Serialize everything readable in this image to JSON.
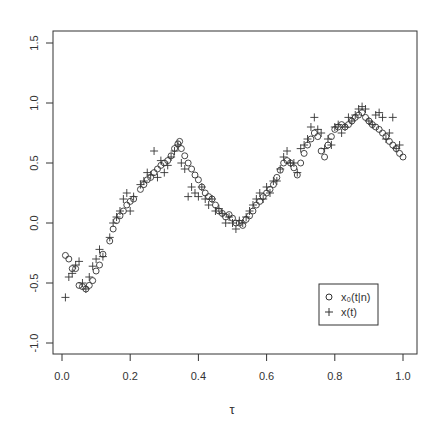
{
  "chart_data": {
    "type": "scatter",
    "title": "",
    "xlabel": "τ",
    "ylabel": "",
    "xlim": [
      0.0,
      1.0
    ],
    "ylim": [
      -1.0,
      1.5
    ],
    "x_ticks": [
      "0.0",
      "0.2",
      "0.4",
      "0.6",
      "0.8",
      "1.0"
    ],
    "y_ticks": [
      "-1.0",
      "-0.5",
      "0.0",
      "0.5",
      "1.0",
      "1.5"
    ],
    "grid": false,
    "legend_position": "bottom-right",
    "legend": [
      {
        "marker": "o",
        "label": "x₀(t|n)"
      },
      {
        "marker": "+",
        "label": "x(t)"
      }
    ],
    "series": [
      {
        "name": "x0(t|n)",
        "marker": "circle",
        "x": [
          0.01,
          0.02,
          0.03,
          0.04,
          0.05,
          0.06,
          0.07,
          0.08,
          0.09,
          0.1,
          0.11,
          0.12,
          0.14,
          0.15,
          0.16,
          0.17,
          0.18,
          0.19,
          0.2,
          0.21,
          0.23,
          0.24,
          0.25,
          0.26,
          0.27,
          0.28,
          0.29,
          0.3,
          0.31,
          0.32,
          0.33,
          0.34,
          0.345,
          0.35,
          0.36,
          0.37,
          0.38,
          0.39,
          0.4,
          0.41,
          0.42,
          0.43,
          0.44,
          0.45,
          0.46,
          0.47,
          0.48,
          0.49,
          0.5,
          0.51,
          0.52,
          0.53,
          0.54,
          0.55,
          0.56,
          0.57,
          0.58,
          0.59,
          0.6,
          0.61,
          0.62,
          0.63,
          0.64,
          0.65,
          0.66,
          0.67,
          0.68,
          0.69,
          0.7,
          0.71,
          0.72,
          0.73,
          0.74,
          0.75,
          0.76,
          0.77,
          0.78,
          0.79,
          0.8,
          0.81,
          0.82,
          0.83,
          0.84,
          0.85,
          0.86,
          0.87,
          0.88,
          0.89,
          0.9,
          0.91,
          0.92,
          0.93,
          0.94,
          0.95,
          0.96,
          0.97,
          0.98,
          0.99,
          1.0
        ],
        "y": [
          -0.27,
          -0.3,
          -0.38,
          -0.38,
          -0.52,
          -0.53,
          -0.55,
          -0.52,
          -0.48,
          -0.4,
          -0.35,
          -0.26,
          -0.15,
          -0.05,
          0.02,
          0.06,
          0.1,
          0.15,
          0.18,
          0.2,
          0.28,
          0.32,
          0.36,
          0.38,
          0.42,
          0.45,
          0.48,
          0.5,
          0.52,
          0.56,
          0.62,
          0.66,
          0.68,
          0.62,
          0.56,
          0.5,
          0.45,
          0.4,
          0.36,
          0.3,
          0.25,
          0.22,
          0.2,
          0.15,
          0.1,
          0.08,
          0.05,
          0.07,
          0.04,
          0.0,
          0.0,
          -0.02,
          0.03,
          0.06,
          0.1,
          0.15,
          0.18,
          0.22,
          0.25,
          0.28,
          0.32,
          0.38,
          0.44,
          0.5,
          0.52,
          0.5,
          0.46,
          0.4,
          0.5,
          0.58,
          0.65,
          0.7,
          0.75,
          0.72,
          0.6,
          0.55,
          0.65,
          0.72,
          0.78,
          0.8,
          0.82,
          0.8,
          0.82,
          0.85,
          0.88,
          0.9,
          0.92,
          0.88,
          0.85,
          0.82,
          0.8,
          0.78,
          0.75,
          0.72,
          0.68,
          0.65,
          0.62,
          0.58,
          0.55
        ]
      },
      {
        "name": "x(t)",
        "marker": "plus",
        "x": [
          0.01,
          0.02,
          0.03,
          0.04,
          0.05,
          0.06,
          0.07,
          0.08,
          0.09,
          0.1,
          0.11,
          0.12,
          0.14,
          0.15,
          0.16,
          0.17,
          0.18,
          0.19,
          0.2,
          0.21,
          0.23,
          0.24,
          0.25,
          0.26,
          0.27,
          0.28,
          0.29,
          0.3,
          0.31,
          0.32,
          0.33,
          0.34,
          0.35,
          0.36,
          0.37,
          0.38,
          0.39,
          0.4,
          0.41,
          0.42,
          0.43,
          0.44,
          0.45,
          0.46,
          0.47,
          0.48,
          0.49,
          0.5,
          0.51,
          0.52,
          0.53,
          0.54,
          0.55,
          0.56,
          0.57,
          0.58,
          0.59,
          0.6,
          0.61,
          0.62,
          0.63,
          0.64,
          0.65,
          0.66,
          0.67,
          0.68,
          0.69,
          0.7,
          0.71,
          0.72,
          0.73,
          0.74,
          0.75,
          0.76,
          0.77,
          0.78,
          0.79,
          0.8,
          0.81,
          0.82,
          0.83,
          0.84,
          0.85,
          0.86,
          0.87,
          0.88,
          0.89,
          0.9,
          0.91,
          0.92,
          0.93,
          0.94,
          0.95,
          0.96,
          0.97,
          0.98,
          0.99
        ],
        "y": [
          -0.62,
          -0.45,
          -0.42,
          -0.35,
          -0.32,
          -0.5,
          -0.55,
          -0.45,
          -0.36,
          -0.3,
          -0.22,
          -0.28,
          -0.12,
          0.0,
          0.05,
          0.1,
          0.2,
          0.25,
          0.1,
          0.22,
          0.32,
          0.35,
          0.42,
          0.4,
          0.6,
          0.38,
          0.52,
          0.42,
          0.48,
          0.55,
          0.6,
          0.65,
          0.5,
          0.45,
          0.22,
          0.3,
          0.25,
          0.22,
          0.3,
          0.2,
          0.15,
          0.2,
          0.1,
          0.12,
          0.08,
          0.0,
          0.05,
          0.0,
          -0.05,
          0.02,
          0.0,
          0.05,
          0.1,
          0.15,
          0.2,
          0.25,
          0.2,
          0.3,
          0.25,
          0.35,
          0.35,
          0.45,
          0.55,
          0.6,
          0.5,
          0.5,
          0.42,
          0.62,
          0.65,
          0.7,
          0.8,
          0.88,
          0.78,
          0.75,
          0.62,
          0.7,
          0.65,
          0.8,
          0.82,
          0.75,
          0.8,
          0.88,
          0.85,
          0.9,
          0.95,
          0.97,
          0.95,
          0.85,
          0.82,
          0.9,
          0.92,
          0.88,
          0.7,
          0.75,
          0.88,
          0.62,
          0.65
        ]
      }
    ]
  }
}
